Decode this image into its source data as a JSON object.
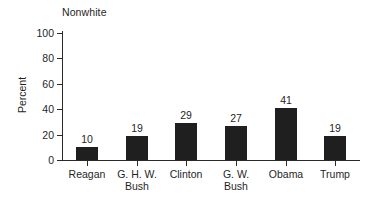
{
  "chart_data": {
    "type": "bar",
    "title": "Nonwhite",
    "xlabel": "",
    "ylabel": "Percent",
    "categories": [
      "Reagan",
      "G. H. W. Bush",
      "Clinton",
      "G. W. Bush",
      "Obama",
      "Trump"
    ],
    "category_lines": [
      [
        "Reagan"
      ],
      [
        "G. H. W.",
        "Bush"
      ],
      [
        "Clinton"
      ],
      [
        "G. W.",
        "Bush"
      ],
      [
        "Obama"
      ],
      [
        "Trump"
      ]
    ],
    "values": [
      10,
      19,
      29,
      27,
      41,
      19
    ],
    "value_labels": [
      "10",
      "19",
      "29",
      "27",
      "41",
      "19"
    ],
    "ylim": [
      0,
      100
    ],
    "yticks": [
      0,
      20,
      40,
      60,
      80,
      100
    ],
    "ytick_labels": [
      "0",
      "20",
      "40",
      "60",
      "80",
      "100"
    ],
    "grid": false,
    "legend": false,
    "bar_color": "#1f1f1f",
    "axis_color": "#2a2a2a",
    "background_color": "#ffffff"
  }
}
